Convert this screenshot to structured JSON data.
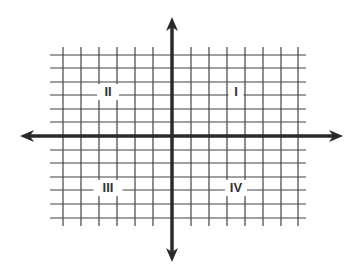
{
  "diagram": {
    "type": "coordinate-plane",
    "colors": {
      "grid": "#444444",
      "axis": "#2a2a2a",
      "label": "#333333",
      "background": "#ffffff"
    },
    "grid": {
      "vertical_lines_x": [
        63,
        81,
        99,
        117,
        135,
        153,
        191,
        209,
        227,
        245,
        263,
        281,
        298
      ],
      "horizontal_lines_y": [
        55,
        68,
        82,
        95,
        109,
        122,
        150,
        163,
        177,
        190,
        204,
        218
      ],
      "x_extent": [
        50,
        306
      ],
      "y_extent": [
        47,
        226
      ]
    },
    "axes": {
      "x_axis": {
        "y": 136,
        "from": 20,
        "to": 343
      },
      "y_axis": {
        "x": 172,
        "from": 17,
        "to": 262
      }
    },
    "quadrants": [
      {
        "id": "I",
        "label": "I",
        "x": 236,
        "y": 94
      },
      {
        "id": "II",
        "label": "II",
        "x": 108,
        "y": 94
      },
      {
        "id": "III",
        "label": "III",
        "x": 108,
        "y": 190
      },
      {
        "id": "IV",
        "label": "IV",
        "x": 236,
        "y": 190
      }
    ]
  }
}
